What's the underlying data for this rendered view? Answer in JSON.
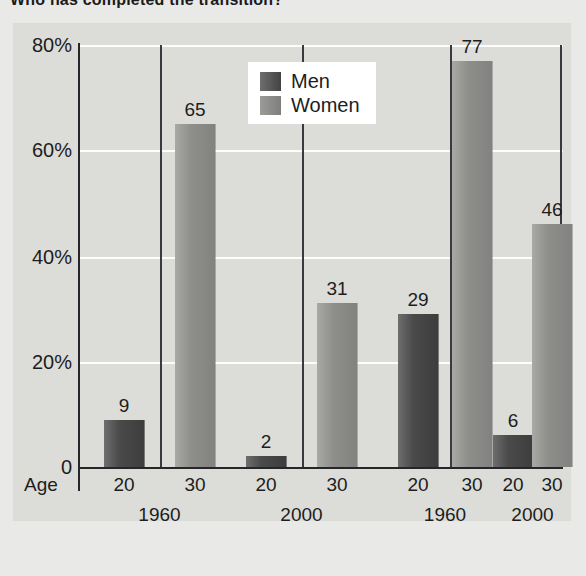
{
  "title": "Who has completed the transition?",
  "legend": {
    "position": "top-center",
    "items": [
      {
        "label": "Men",
        "color": "#4a4a4a",
        "key": "men"
      },
      {
        "label": "Women",
        "color": "#8e8e8b",
        "key": "women"
      }
    ]
  },
  "axis": {
    "age_label": "Age",
    "yticks": [
      "80%",
      "60%",
      "40%",
      "20%",
      "0"
    ]
  },
  "chart_data": {
    "type": "bar",
    "title": "Who has completed the transition?",
    "xlabel": "Age",
    "ylabel": "",
    "ylim": [
      0,
      80
    ],
    "yticks": [
      0,
      20,
      40,
      60,
      80
    ],
    "ytick_labels": [
      "0",
      "20%",
      "40%",
      "60%",
      "80%"
    ],
    "grid": true,
    "legend": [
      "Men",
      "Women"
    ],
    "legend_position": "top-center",
    "categories": [
      "Age 20",
      "Age 30",
      "Age 20",
      "Age 30",
      "Age 20",
      "Age 30",
      "Age 20",
      "Age 30"
    ],
    "groups": [
      {
        "series": "Men",
        "year": "1960",
        "points": [
          {
            "age": "20",
            "value": 9
          },
          {
            "age": "30",
            "value": 65
          }
        ]
      },
      {
        "series": "Men",
        "year": "2000",
        "points": [
          {
            "age": "20",
            "value": 2
          },
          {
            "age": "30",
            "value": 31
          }
        ]
      },
      {
        "series": "Women",
        "year": "1960",
        "points": [
          {
            "age": "20",
            "value": 29
          },
          {
            "age": "30",
            "value": 77
          }
        ]
      },
      {
        "series": "Women",
        "year": "2000",
        "points": [
          {
            "age": "20",
            "value": 6
          },
          {
            "age": "30",
            "value": 46
          }
        ]
      }
    ],
    "values": [
      9,
      65,
      2,
      31,
      29,
      77,
      6,
      46
    ],
    "value_labels": [
      "9",
      "65",
      "2",
      "31",
      "29",
      "77",
      "6",
      "46"
    ],
    "group_labels": [
      "1960",
      "2000",
      "1960",
      "2000"
    ],
    "age_labels": [
      "20",
      "30",
      "20",
      "30",
      "20",
      "30",
      "20",
      "30"
    ]
  },
  "bars": [
    {
      "label": "9",
      "value": 9,
      "series": "men",
      "left": 24,
      "width": 40
    },
    {
      "label": "65",
      "value": 65,
      "series": "women",
      "left": 95,
      "width": 40
    },
    {
      "label": "2",
      "value": 2,
      "series": "men",
      "left": 166,
      "width": 40
    },
    {
      "label": "31",
      "value": 31,
      "series": "women",
      "left": 237,
      "width": 40
    },
    {
      "label": "29",
      "value": 29,
      "series": "men",
      "left": 318,
      "width": 40
    },
    {
      "label": "77",
      "value": 77,
      "series": "women",
      "left": 372,
      "width": 40
    },
    {
      "label": "6",
      "value": 6,
      "series": "men",
      "left": 413,
      "width": 40
    },
    {
      "label": "46",
      "value": 46,
      "series": "women",
      "left": 452,
      "width": 40
    }
  ]
}
